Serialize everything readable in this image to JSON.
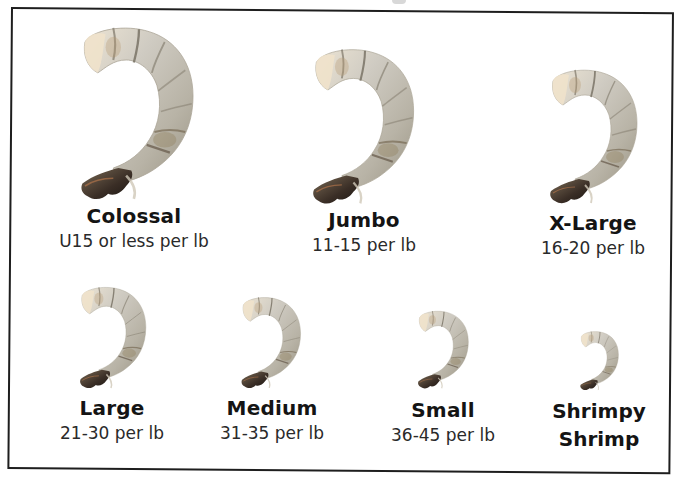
{
  "chart": {
    "colors": {
      "border": "#1e1e1e",
      "text_dark": "#141414",
      "text_sub": "#2a2a2a",
      "shrimp_body": "#c9c6bd",
      "shrimp_shadow": "#8f8a7c",
      "shrimp_tail": "#3d3128",
      "shrimp_head": "#e9dcc6"
    },
    "sizes": [
      {
        "name": "Colossal",
        "count": "U15 or less per lb",
        "icon": "shrimp-icon"
      },
      {
        "name": "Jumbo",
        "count": "11-15 per lb",
        "icon": "shrimp-icon"
      },
      {
        "name": "X-Large",
        "count": "16-20 per lb",
        "icon": "shrimp-icon"
      },
      {
        "name": "Large",
        "count": "21-30 per lb",
        "icon": "shrimp-icon"
      },
      {
        "name": "Medium",
        "count": "31-35 per lb",
        "icon": "shrimp-icon"
      },
      {
        "name": "Small",
        "count": "36-45 per lb",
        "icon": "shrimp-icon"
      },
      {
        "name_line1": "Shrimpy",
        "name_line2": "Shrimp",
        "icon": "shrimp-icon"
      }
    ]
  }
}
